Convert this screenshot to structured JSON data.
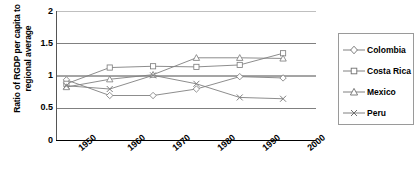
{
  "chart_data": {
    "type": "line",
    "title": "",
    "xlabel": "",
    "ylabel": "Ratio of RGDP per capita to regional average",
    "categories": [
      "1950",
      "1960",
      "1970",
      "1980",
      "1990",
      "2000"
    ],
    "ylim": [
      0,
      2
    ],
    "yticks": [
      "0",
      "0.5",
      "1",
      "1.5",
      "2"
    ],
    "ytick_values": [
      0,
      0.5,
      1,
      1.5,
      2
    ],
    "grid": true,
    "legend_position": "right",
    "series": [
      {
        "name": "Colombia",
        "marker": "diamond",
        "values": [
          0.94,
          0.7,
          0.7,
          0.8,
          0.99,
          0.97
        ]
      },
      {
        "name": "Costa Rica",
        "marker": "square",
        "values": [
          0.88,
          1.13,
          1.15,
          1.14,
          1.17,
          1.35
        ]
      },
      {
        "name": "Mexico",
        "marker": "triangle",
        "values": [
          0.83,
          0.95,
          1.02,
          1.28,
          1.28,
          1.27
        ]
      },
      {
        "name": "Peru",
        "marker": "cross",
        "values": [
          0.85,
          0.8,
          1.01,
          0.88,
          0.67,
          0.65
        ]
      }
    ],
    "colors": {
      "axis": "#000000",
      "grid": "#808080",
      "series_line": "#808080",
      "marker_stroke": "#808080",
      "legend_border": "#9a9a9a",
      "background": "#ffffff"
    }
  },
  "legend": {
    "items": [
      {
        "label": "Colombia"
      },
      {
        "label": "Costa Rica"
      },
      {
        "label": "Mexico"
      },
      {
        "label": "Peru"
      }
    ]
  },
  "axes": {
    "y_title": "Ratio of RGDP per capita to regional average",
    "y_title_line1": "Ratio of RGDP per capita to",
    "y_title_line2": "regional average",
    "y_labels": [
      "2",
      "1.5",
      "1",
      "0.5",
      "0"
    ],
    "x_labels": [
      "1950",
      "1960",
      "1970",
      "1980",
      "1990",
      "2000"
    ]
  }
}
